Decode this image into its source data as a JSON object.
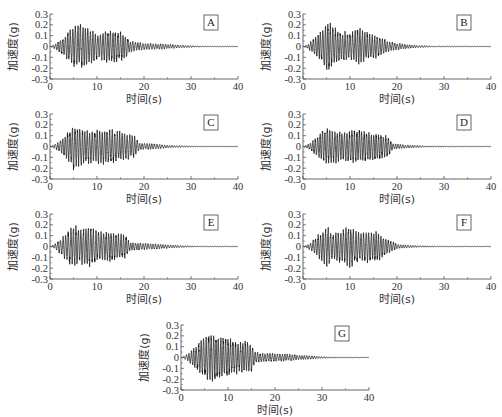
{
  "chart_data": [
    {
      "type": "line",
      "panel_label": "A",
      "xlabel": "时间(s)",
      "ylabel": "加速度(g)",
      "xlim": [
        0,
        40
      ],
      "ylim": [
        -0.3,
        0.3
      ],
      "xticks": [
        0,
        10,
        20,
        30,
        40
      ],
      "yticks": [
        0.3,
        0.2,
        0.1,
        0,
        -0.1,
        -0.2,
        -0.3
      ],
      "ytick_labels": [
        "0.3",
        "0.2",
        "0.1",
        "0",
        "-0.1",
        "-0.2",
        "-0.3"
      ],
      "grid": false,
      "description": "Seismic acceleration time history; strong motion ~2-17 s, peak ~ +0.2 / -0.22 g, decaying to ~0 by 30 s",
      "envelope": {
        "t": [
          0,
          1,
          2,
          4,
          6,
          8,
          10,
          12,
          14,
          16,
          17,
          20,
          24,
          28,
          32,
          40
        ],
        "amp": [
          0,
          0.02,
          0.06,
          0.14,
          0.21,
          0.18,
          0.12,
          0.16,
          0.14,
          0.12,
          0.05,
          0.03,
          0.025,
          0.012,
          0.004,
          0.002
        ]
      },
      "peak_positive": 0.2,
      "peak_negative": -0.22
    },
    {
      "type": "line",
      "panel_label": "B",
      "xlabel": "时间(s)",
      "ylabel": "加速度(g)",
      "xlim": [
        0,
        40
      ],
      "ylim": [
        -0.3,
        0.3
      ],
      "xticks": [
        0,
        10,
        20,
        30,
        40
      ],
      "yticks": [
        0.3,
        0.2,
        0.1,
        0,
        -0.1,
        -0.2,
        -0.3
      ],
      "ytick_labels": [
        "0.3",
        "0.2",
        "0.1",
        "0",
        "-0.1",
        "-0.2",
        "-0.3"
      ],
      "grid": false,
      "description": "Seismic acceleration time history; peak ~ +0.23 g near 5 s, second burst ~12 s, decays by ~25 s",
      "envelope": {
        "t": [
          0,
          1,
          2,
          4,
          5,
          6,
          8,
          10,
          12,
          14,
          16,
          18,
          20,
          24,
          28,
          40
        ],
        "amp": [
          0,
          0.02,
          0.06,
          0.15,
          0.22,
          0.2,
          0.14,
          0.12,
          0.17,
          0.12,
          0.1,
          0.05,
          0.03,
          0.012,
          0.004,
          0.002
        ]
      },
      "peak_positive": 0.23,
      "peak_negative": -0.21
    },
    {
      "type": "line",
      "panel_label": "C",
      "xlabel": "时间(s)",
      "ylabel": "加速度(g)",
      "xlim": [
        0,
        40
      ],
      "ylim": [
        -0.3,
        0.3
      ],
      "xticks": [
        0,
        10,
        20,
        30,
        40
      ],
      "yticks": [
        0.3,
        0.2,
        0.1,
        0,
        -0.1,
        -0.2,
        -0.3
      ],
      "ytick_labels": [
        "0.3",
        "0.2",
        "0.1",
        "0",
        "-0.1",
        "-0.2",
        "-0.3"
      ],
      "grid": false,
      "description": "Seismic acceleration time history; strong motion 2-18 s, peak ~ +0.22 / -0.23 g at ~5 s",
      "envelope": {
        "t": [
          0,
          1,
          2,
          4,
          5,
          6,
          8,
          10,
          12,
          14,
          16,
          18,
          19,
          22,
          26,
          32,
          40
        ],
        "amp": [
          0,
          0.02,
          0.05,
          0.14,
          0.22,
          0.17,
          0.15,
          0.15,
          0.16,
          0.15,
          0.13,
          0.1,
          0.03,
          0.025,
          0.01,
          0.003,
          0.002
        ]
      },
      "peak_positive": 0.22,
      "peak_negative": -0.23
    },
    {
      "type": "line",
      "panel_label": "D",
      "xlabel": "时间(s)",
      "ylabel": "加速度(g)",
      "xlim": [
        0,
        40
      ],
      "ylim": [
        -0.3,
        0.3
      ],
      "xticks": [
        0,
        10,
        20,
        30,
        40
      ],
      "yticks": [
        0.3,
        0.2,
        0.1,
        0,
        -0.1,
        -0.2,
        -0.3
      ],
      "ytick_labels": [
        "0.3",
        "0.2",
        "0.1",
        "0",
        "-0.1",
        "-0.2",
        "-0.3"
      ],
      "grid": false,
      "description": "Seismic acceleration time history; strong motion 2-18 s, peak ~ +0.2 / -0.19 g",
      "envelope": {
        "t": [
          0,
          1,
          2,
          4,
          5,
          6,
          8,
          10,
          12,
          14,
          16,
          18,
          19,
          22,
          26,
          32,
          40
        ],
        "amp": [
          0,
          0.02,
          0.05,
          0.13,
          0.19,
          0.15,
          0.14,
          0.15,
          0.15,
          0.14,
          0.12,
          0.1,
          0.03,
          0.015,
          0.006,
          0.003,
          0.002
        ]
      },
      "peak_positive": 0.2,
      "peak_negative": -0.19
    },
    {
      "type": "line",
      "panel_label": "E",
      "xlabel": "时间(s)",
      "ylabel": "加速度(g)",
      "xlim": [
        0,
        40
      ],
      "ylim": [
        -0.3,
        0.3
      ],
      "xticks": [
        0,
        10,
        20,
        30,
        40
      ],
      "yticks": [
        0.3,
        0.2,
        0.1,
        0,
        -0.1,
        -0.2,
        -0.3
      ],
      "ytick_labels": [
        "0.3",
        "0.2",
        "0.1",
        "0",
        "-0.1",
        "-0.2",
        "-0.3"
      ],
      "grid": false,
      "description": "Seismic acceleration time history; strong motion 2-16 s, peaks ~ +0.2 g at 5 s and 8 s",
      "envelope": {
        "t": [
          0,
          1,
          2,
          4,
          5,
          6,
          8,
          10,
          12,
          14,
          16,
          17,
          20,
          24,
          28,
          32,
          40
        ],
        "amp": [
          0,
          0.02,
          0.06,
          0.15,
          0.2,
          0.16,
          0.2,
          0.14,
          0.14,
          0.13,
          0.11,
          0.04,
          0.03,
          0.02,
          0.008,
          0.003,
          0.002
        ]
      },
      "peak_positive": 0.2,
      "peak_negative": -0.18
    },
    {
      "type": "line",
      "panel_label": "F",
      "xlabel": "时间(s)",
      "ylabel": "加速度(g)",
      "xlim": [
        0,
        40
      ],
      "ylim": [
        -0.3,
        0.3
      ],
      "xticks": [
        0,
        10,
        20,
        30,
        40
      ],
      "yticks": [
        0.3,
        0.2,
        0.1,
        0,
        -0.1,
        -0.2,
        -0.3
      ],
      "ytick_labels": [
        "0.3",
        "0.2",
        "0.1",
        "0",
        "-0.1",
        "-0.2",
        "-0.3"
      ],
      "grid": false,
      "description": "Seismic acceleration time history; strong motion 2-18 s, peak ~ +0.19 g at 10 s, -0.2 g at 5 s",
      "envelope": {
        "t": [
          0,
          1,
          2,
          4,
          5,
          6,
          8,
          10,
          12,
          14,
          16,
          18,
          20,
          24,
          30,
          40
        ],
        "amp": [
          0,
          0.02,
          0.05,
          0.14,
          0.19,
          0.14,
          0.14,
          0.19,
          0.13,
          0.15,
          0.13,
          0.07,
          0.02,
          0.008,
          0.003,
          0.002
        ]
      },
      "peak_positive": 0.19,
      "peak_negative": -0.2
    },
    {
      "type": "line",
      "panel_label": "G",
      "xlabel": "时间(s)",
      "ylabel": "加速度(g)",
      "xlim": [
        0,
        40
      ],
      "ylim": [
        -0.3,
        0.3
      ],
      "xticks": [
        0,
        10,
        20,
        30,
        40
      ],
      "yticks": [
        0.3,
        0.2,
        0.1,
        0,
        -0.1,
        -0.2,
        -0.3
      ],
      "ytick_labels": [
        "0.3",
        "0.2",
        "0.1",
        "0",
        "-0.1",
        "-0.2",
        "-0.3"
      ],
      "grid": false,
      "description": "Seismic acceleration time history; peak ~ +0.23 g at ~6 s, long decaying coda to ~30 s",
      "envelope": {
        "t": [
          0,
          1,
          2,
          4,
          6,
          8,
          10,
          12,
          14,
          15,
          16,
          18,
          22,
          26,
          30,
          34,
          40
        ],
        "amp": [
          0,
          0.02,
          0.06,
          0.15,
          0.23,
          0.2,
          0.18,
          0.15,
          0.15,
          0.12,
          0.05,
          0.04,
          0.035,
          0.02,
          0.008,
          0.003,
          0.002
        ]
      },
      "peak_positive": 0.23,
      "peak_negative": -0.23
    }
  ],
  "layout": {
    "panels": [
      {
        "id": "A",
        "left": 0,
        "top": 0
      },
      {
        "id": "B",
        "left": 253,
        "top": 0
      },
      {
        "id": "C",
        "left": 0,
        "top": 100
      },
      {
        "id": "D",
        "left": 253,
        "top": 100
      },
      {
        "id": "E",
        "left": 0,
        "top": 200
      },
      {
        "id": "F",
        "left": 253,
        "top": 200
      },
      {
        "id": "G",
        "left": 131,
        "top": 311
      }
    ],
    "line_color": "#111111",
    "axis_color": "#555555"
  }
}
